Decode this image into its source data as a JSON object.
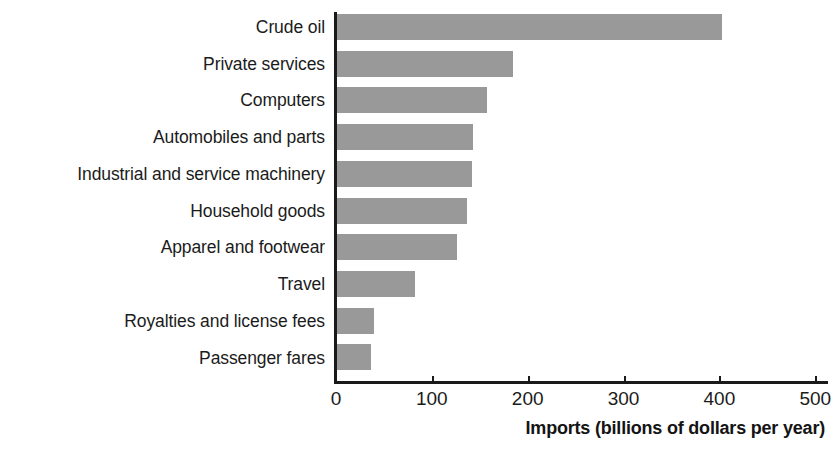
{
  "chart_data": {
    "type": "bar",
    "orientation": "horizontal",
    "title": "",
    "xlabel": "Imports (billions of dollars per year)",
    "ylabel": "",
    "categories": [
      "Crude oil",
      "Private services",
      "Computers",
      "Automobiles and parts",
      "Industrial and service machinery",
      "Household goods",
      "Apparel and footwear",
      "Travel",
      "Royalties and license fees",
      "Passenger fares"
    ],
    "values": [
      403,
      185,
      158,
      143,
      142,
      137,
      126,
      82,
      40,
      36
    ],
    "xlim": [
      0,
      520
    ],
    "xticks": [
      0,
      100,
      200,
      300,
      400,
      500
    ],
    "xtick_labels": [
      "0",
      "100",
      "200",
      "300",
      "400",
      "500"
    ],
    "grid": false,
    "legend": false,
    "bar_color": "#999999",
    "axis_color": "#1a1a1a",
    "background": "#ffffff"
  }
}
